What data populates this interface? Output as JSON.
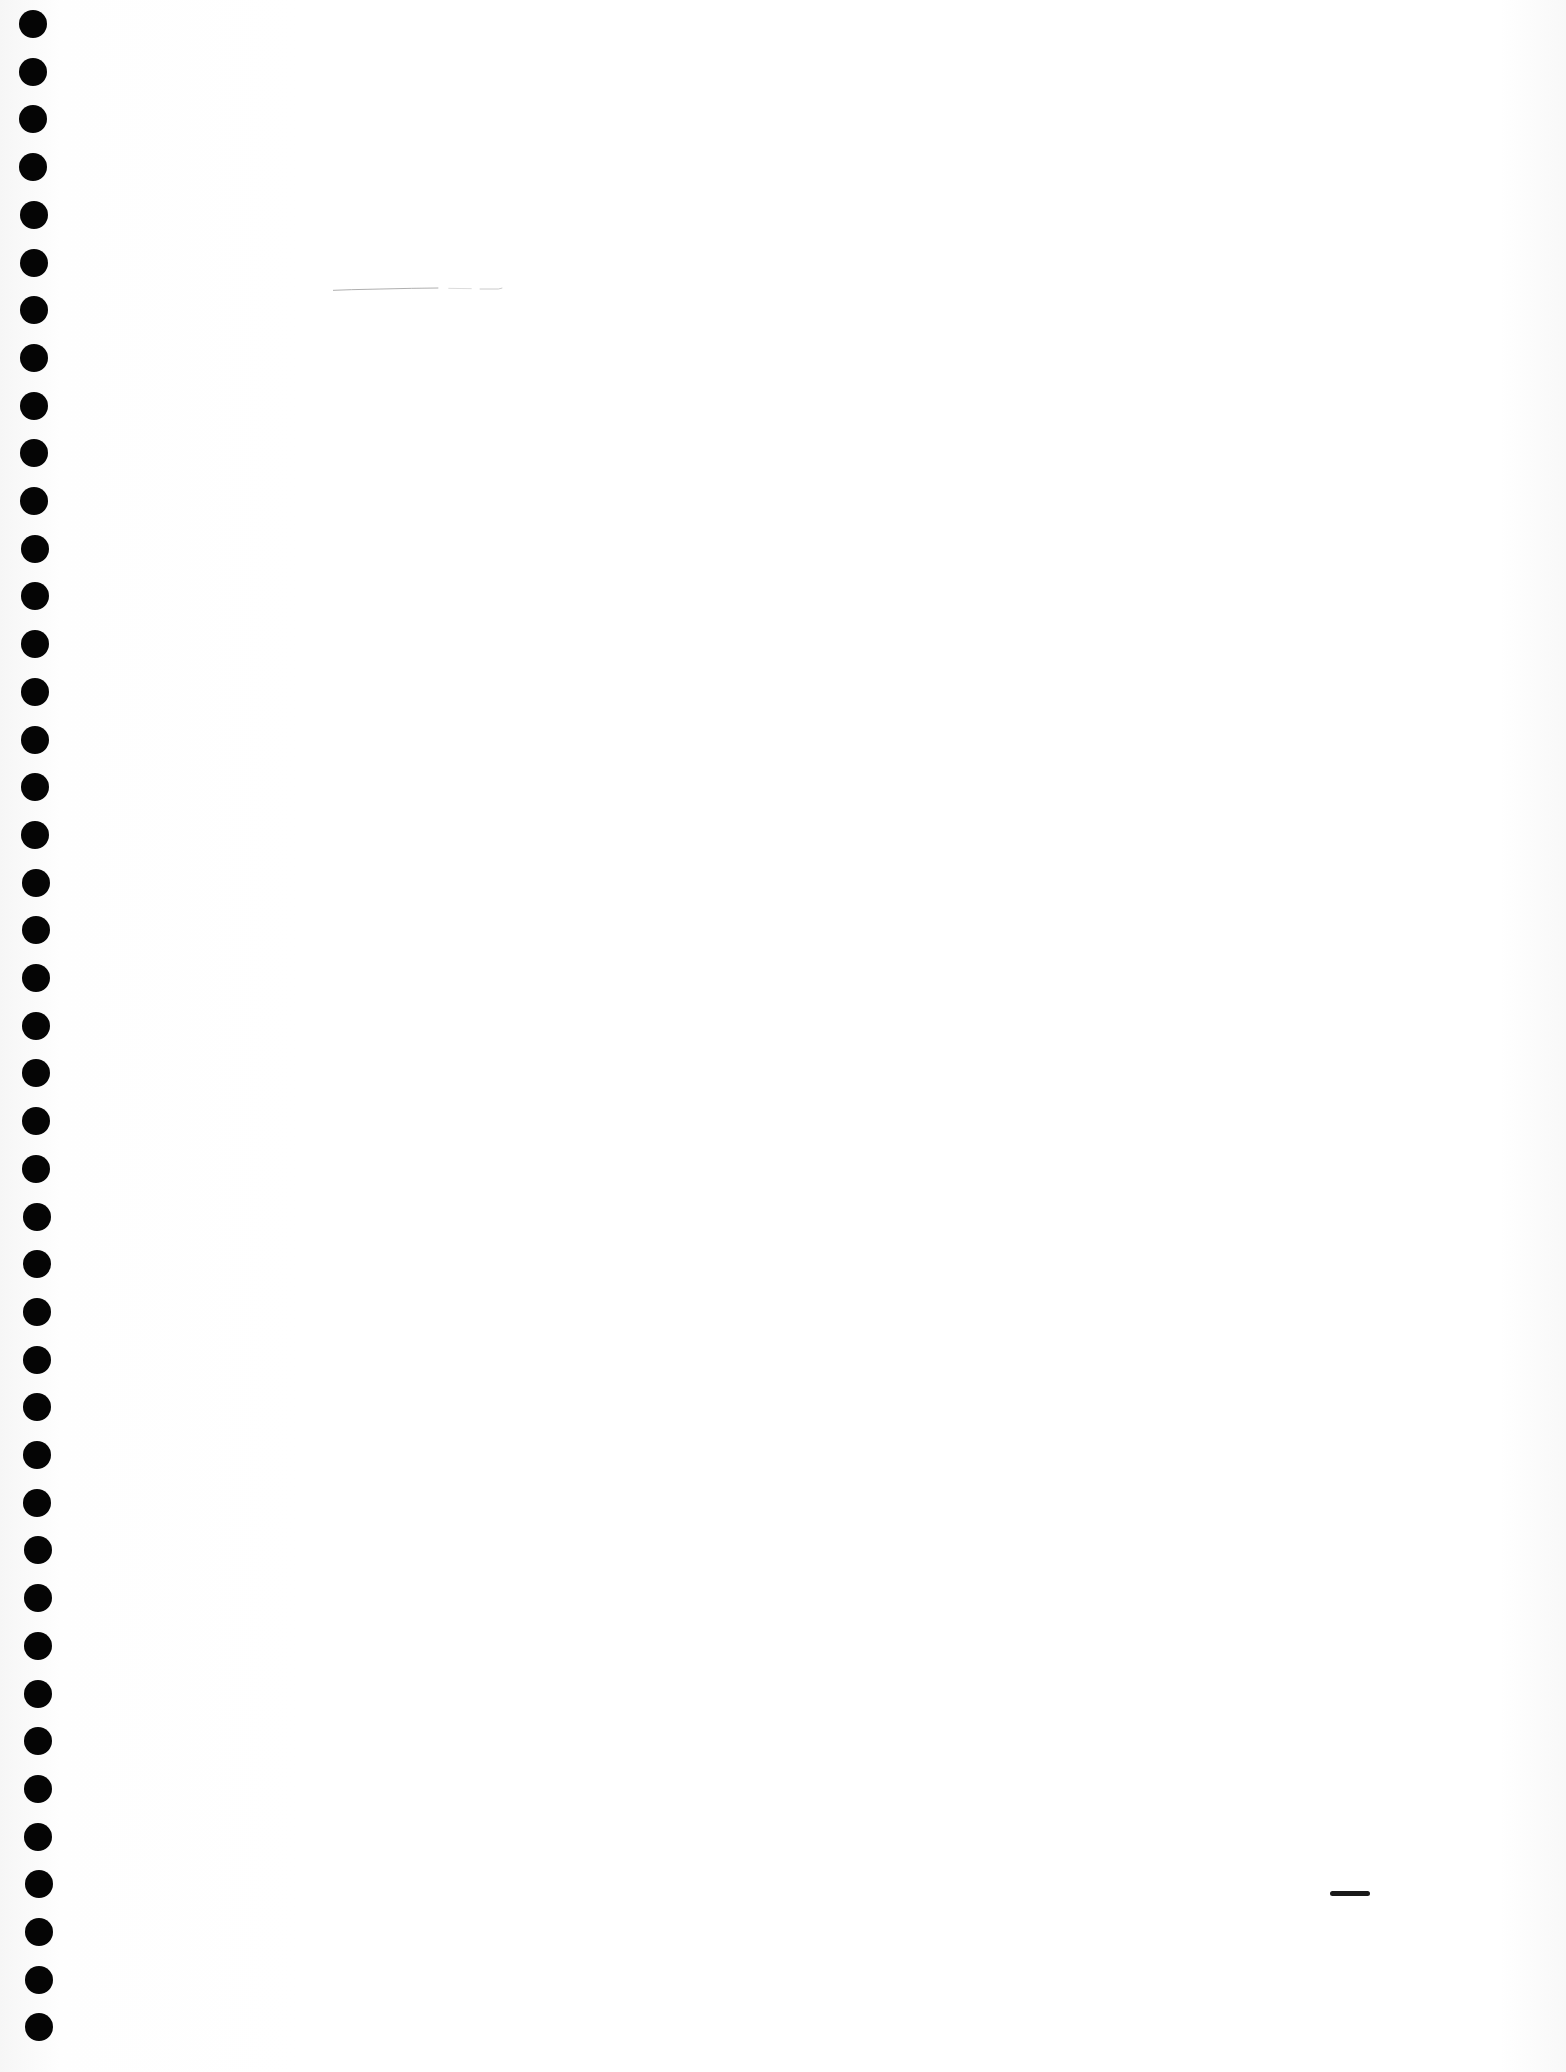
{
  "page": {
    "type": "blank notebook page (scanned)",
    "background_color": "#ffffff",
    "punch_holes": {
      "count": 43,
      "color": "#050505",
      "first_y": 24,
      "spacing_px": 47.7,
      "x_start": 33,
      "x_end": 39,
      "diameter_px": 28
    },
    "marks": [
      {
        "kind": "faint-pencil-stroke",
        "x": 285,
        "y": 287,
        "width": 280
      },
      {
        "kind": "short-pen-dash",
        "x": 1330,
        "y": 1891,
        "width": 40
      }
    ]
  }
}
